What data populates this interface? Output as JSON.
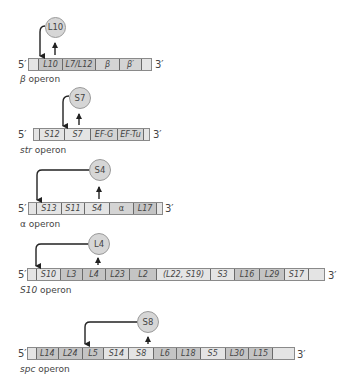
{
  "colors": {
    "bar_fill": "#d9d9d9",
    "segment_dark": "#c4c4c4",
    "segment_light": "#e4e4e4",
    "protein_fill": "#d6d6d6",
    "arrow": "#222222",
    "text": "#444444"
  },
  "end_labels": {
    "five_prime": "5′",
    "three_prime": "3′"
  },
  "operons": [
    {
      "name": "β operon",
      "name_prefix": "β",
      "name_suffix": " operon",
      "regulator": "L10",
      "genes": [
        "L10",
        "L7/L12",
        "β",
        "β′"
      ]
    },
    {
      "name": "str operon",
      "name_prefix": "str",
      "name_suffix": " operon",
      "regulator": "S7",
      "genes": [
        "S12",
        "S7",
        "EF-G",
        "EF-Tu"
      ]
    },
    {
      "name": "α operon",
      "name_prefix": "α",
      "name_suffix": " operon",
      "regulator": "S4",
      "genes": [
        "S13",
        "S11",
        "S4",
        "α",
        "L17"
      ]
    },
    {
      "name": "S10 operon",
      "name_prefix": "S10",
      "name_suffix": " operon",
      "regulator": "L4",
      "genes": [
        "S10",
        "L3",
        "L4",
        "L23",
        "L2",
        "(L22, S19)",
        "S3",
        "L16",
        "L29",
        "S17"
      ]
    },
    {
      "name": "spc operon",
      "name_prefix": "spc",
      "name_suffix": " operon",
      "regulator": "S8",
      "genes": [
        "L14",
        "L24",
        "L5",
        "S14",
        "S8",
        "L6",
        "L18",
        "S5",
        "L30",
        "L15"
      ]
    }
  ]
}
